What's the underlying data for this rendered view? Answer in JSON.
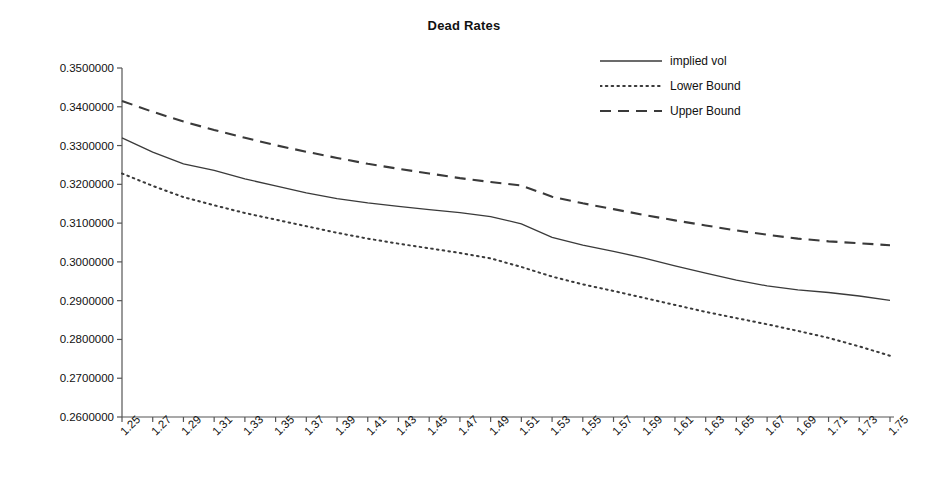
{
  "chart_data": {
    "type": "line",
    "title": "Dead Rates",
    "xlabel": "",
    "ylabel": "",
    "grid": false,
    "legend_position": "top-right",
    "xlim": [
      1.25,
      1.75
    ],
    "ylim": [
      0.26,
      0.35
    ],
    "x": [
      1.25,
      1.27,
      1.29,
      1.31,
      1.33,
      1.35,
      1.37,
      1.39,
      1.41,
      1.43,
      1.45,
      1.47,
      1.49,
      1.51,
      1.53,
      1.55,
      1.57,
      1.59,
      1.61,
      1.63,
      1.65,
      1.67,
      1.69,
      1.71,
      1.73,
      1.75
    ],
    "categories": [
      "1.25",
      "1.27",
      "1.29",
      "1.31",
      "1.33",
      "1.35",
      "1.37",
      "1.39",
      "1.41",
      "1.43",
      "1.45",
      "1.47",
      "1.49",
      "1.51",
      "1.53",
      "1.55",
      "1.57",
      "1.59",
      "1.61",
      "1.63",
      "1.65",
      "1.67",
      "1.69",
      "1.71",
      "1.73",
      "1.75"
    ],
    "xticklabels": [
      "1.25",
      "1.27",
      "1.29",
      "1.31",
      "1.33",
      "1.35",
      "1.37",
      "1.39",
      "1.41",
      "1.43",
      "1.45",
      "1.47",
      "1.49",
      "1.51",
      "1.53",
      "1.55",
      "1.57",
      "1.59",
      "1.61",
      "1.63",
      "1.65",
      "1.67",
      "1.69",
      "1.71",
      "1.73",
      "1.75"
    ],
    "yticklabels": [
      "0.3500000",
      "0.3400000",
      "0.3300000",
      "0.3200000",
      "0.3100000",
      "0.3000000",
      "0.2900000",
      "0.2800000",
      "0.2700000",
      "0.2600000"
    ],
    "yticks": [
      0.35,
      0.34,
      0.33,
      0.32,
      0.31,
      0.3,
      0.29,
      0.28,
      0.27,
      0.26
    ],
    "series": [
      {
        "name": "implied vol",
        "style": "solid",
        "color": "#3a3a3a",
        "values": [
          0.332,
          0.3283,
          0.3253,
          0.3236,
          0.3214,
          0.3196,
          0.3178,
          0.3163,
          0.3152,
          0.3143,
          0.3135,
          0.3127,
          0.3117,
          0.3098,
          0.3063,
          0.3043,
          0.3027,
          0.301,
          0.299,
          0.2971,
          0.2953,
          0.2938,
          0.2928,
          0.2921,
          0.2912,
          0.2901
        ]
      },
      {
        "name": "Lower Bound",
        "style": "dotted",
        "color": "#3a3a3a",
        "values": [
          0.3228,
          0.3196,
          0.3167,
          0.3146,
          0.3126,
          0.3109,
          0.3092,
          0.3075,
          0.306,
          0.3047,
          0.3035,
          0.3023,
          0.3009,
          0.2987,
          0.2962,
          0.2942,
          0.2925,
          0.2907,
          0.2889,
          0.2871,
          0.2855,
          0.2839,
          0.2822,
          0.2804,
          0.2782,
          0.2758
        ]
      },
      {
        "name": "Upper Bound",
        "style": "dashed",
        "color": "#3a3a3a",
        "values": [
          0.3415,
          0.3387,
          0.3362,
          0.334,
          0.332,
          0.3301,
          0.3284,
          0.3268,
          0.3253,
          0.324,
          0.3228,
          0.3216,
          0.3206,
          0.3197,
          0.3168,
          0.3151,
          0.3136,
          0.3121,
          0.3107,
          0.3094,
          0.3081,
          0.307,
          0.306,
          0.3053,
          0.3048,
          0.3043
        ]
      }
    ]
  }
}
